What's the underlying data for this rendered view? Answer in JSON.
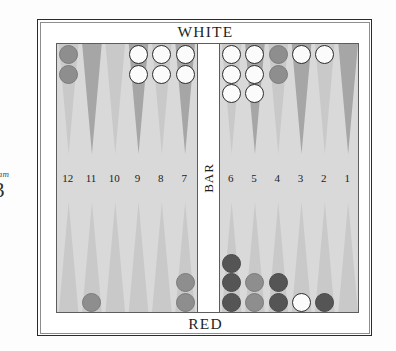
{
  "caption": {
    "word": "ram",
    "number": "3"
  },
  "board": {
    "top_label": "WHITE",
    "bottom_label": "RED",
    "bar_label": "BAR",
    "point_numbers_left": [
      "12",
      "11",
      "10",
      "9",
      "8",
      "7"
    ],
    "point_numbers_right": [
      "6",
      "5",
      "4",
      "3",
      "2",
      "1"
    ],
    "colors": {
      "frame": "#2b2b2b",
      "field_background": "#d9d9d9",
      "bar_background": "#ffffff",
      "point_light": "#c9c9c9",
      "point_dark": "#a6a6a6",
      "checker_white": "#fbfbfb",
      "checker_red": "#8e8e8e",
      "checker_red_dark": "#555555",
      "text": "#1f1f1f"
    }
  },
  "chart_data": {
    "type": "table",
    "categories": [
      "12",
      "11",
      "10",
      "9",
      "8",
      "7",
      "6",
      "5",
      "4",
      "3",
      "2",
      "1"
    ],
    "series": [
      {
        "name": "top (WHITE home row)",
        "values": [
          2,
          0,
          0,
          2,
          2,
          2,
          3,
          3,
          2,
          1,
          1,
          0
        ],
        "owners": [
          "red",
          "",
          "",
          "white",
          "white",
          "white",
          "white",
          "white",
          "red",
          "white",
          "white",
          ""
        ]
      },
      {
        "name": "bottom (RED home row)",
        "values": [
          0,
          1,
          0,
          0,
          0,
          2,
          3,
          2,
          2,
          1,
          1,
          0
        ],
        "owners": [
          "",
          "red",
          "",
          "",
          "",
          "red",
          "red",
          "red",
          "red",
          "white",
          "red",
          ""
        ]
      }
    ],
    "bar": {
      "white": 0,
      "red": 0
    },
    "legend": [
      "WHITE",
      "RED"
    ]
  },
  "checkers": {
    "top": [
      {
        "point": "12",
        "side": "left",
        "index": 0,
        "count": 2,
        "color": "red",
        "shade": "mid"
      },
      {
        "point": "9",
        "side": "left",
        "index": 3,
        "count": 2,
        "color": "white",
        "shade": "mid"
      },
      {
        "point": "8",
        "side": "left",
        "index": 4,
        "count": 2,
        "color": "white",
        "shade": "mid"
      },
      {
        "point": "7",
        "side": "left",
        "index": 5,
        "count": 2,
        "color": "white",
        "shade": "mid"
      },
      {
        "point": "6",
        "side": "right",
        "index": 0,
        "count": 3,
        "color": "white",
        "shade": "mid"
      },
      {
        "point": "5",
        "side": "right",
        "index": 1,
        "count": 3,
        "color": "white",
        "shade": "mid"
      },
      {
        "point": "4",
        "side": "right",
        "index": 2,
        "count": 2,
        "color": "red",
        "shade": "mid"
      },
      {
        "point": "3",
        "side": "right",
        "index": 3,
        "count": 1,
        "color": "white",
        "shade": "mid"
      },
      {
        "point": "2",
        "side": "right",
        "index": 4,
        "count": 1,
        "color": "white",
        "shade": "mid"
      }
    ],
    "bottom": [
      {
        "point": "11",
        "side": "left",
        "index": 1,
        "count": 1,
        "color": "red",
        "shade": "mid"
      },
      {
        "point": "7",
        "side": "left",
        "index": 5,
        "count": 2,
        "color": "red",
        "shade": "mid"
      },
      {
        "point": "6",
        "side": "right",
        "index": 0,
        "count": 3,
        "color": "red",
        "shade": "dark"
      },
      {
        "point": "5",
        "side": "right",
        "index": 1,
        "count": 2,
        "color": "red",
        "shade": "mid"
      },
      {
        "point": "4",
        "side": "right",
        "index": 2,
        "count": 2,
        "color": "red",
        "shade": "dark"
      },
      {
        "point": "3",
        "side": "right",
        "index": 3,
        "count": 1,
        "color": "white",
        "shade": "mid"
      },
      {
        "point": "2",
        "side": "right",
        "index": 4,
        "count": 1,
        "color": "red",
        "shade": "dark"
      }
    ]
  },
  "point_shades": {
    "top_left": [
      "light",
      "dark",
      "light",
      "dark",
      "light",
      "dark"
    ],
    "top_right": [
      "light",
      "dark",
      "light",
      "dark",
      "light",
      "dark"
    ],
    "bottom_left": [
      "light",
      "light",
      "light",
      "light",
      "light",
      "light"
    ],
    "bottom_right": [
      "light",
      "light",
      "light",
      "light",
      "light",
      "light"
    ]
  }
}
